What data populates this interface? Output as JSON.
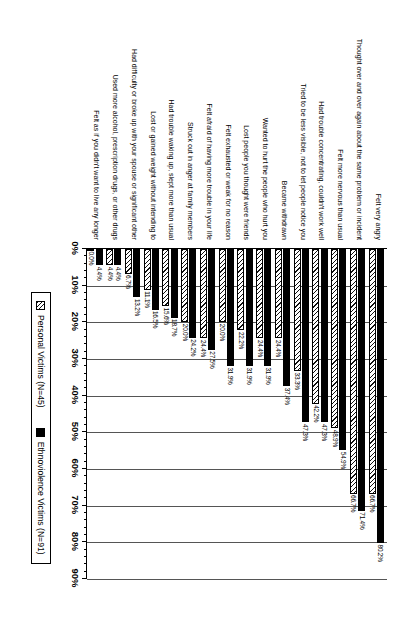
{
  "chart_data": {
    "type": "bar",
    "orientation": "horizontal",
    "title": "",
    "xlabel": "",
    "ylabel": "",
    "xlim": [
      0,
      90
    ],
    "xticks": [
      "0%",
      "10%",
      "20%",
      "30%",
      "40%",
      "50%",
      "60%",
      "70%",
      "80%",
      "90%"
    ],
    "grid": true,
    "legend_position": "bottom-right",
    "categories": [
      "Felt very angry",
      "Thought over and over again about the same problem or incident",
      "Felt more nervous than usual",
      "Had trouble concentrating, couldn't work well",
      "Tried to be less visible, not to let people notice you",
      "Became withdrawn",
      "Wanted to hurt the people who hurt you",
      "Lost people you thought were friends",
      "Felt exhausted or weak for no reason",
      "Felt afraid of having more trouble in your life",
      "Struck out in anger at family members",
      "Had trouble waking up, slept more than usual",
      "Lost or gained weight without intending to",
      "Had difficulty or broke up with your spouse or significant other",
      "Used more alcohol, prescription drugs, or other drugs",
      "Felt as if you didn't want to live any longer"
    ],
    "series": [
      {
        "name": "Ethnoviolence Victims (N=91)",
        "style": "solid-black",
        "color": "#000000",
        "values": [
          80.2,
          71.4,
          54.9,
          47.3,
          47.3,
          37.4,
          31.9,
          31.9,
          31.9,
          27.5,
          24.2,
          18.7,
          16.5,
          13.2,
          4.4,
          4.4
        ],
        "labels": [
          "80.2%",
          "71.4%",
          "54.9%",
          "47.3%",
          "47.3%",
          "37.4%",
          "31.9%",
          "31.9%",
          "31.9%",
          "27.5%",
          "24.2%",
          "18.7%",
          "16.5%",
          "13.2%",
          "4.4%",
          "4.4%"
        ]
      },
      {
        "name": "Personal Victims (N=45)",
        "style": "hatched",
        "color": "#ffffff",
        "values": [
          66.7,
          66.7,
          48.9,
          42.2,
          33.3,
          24.4,
          24.4,
          22.2,
          20.0,
          24.4,
          20.0,
          15.6,
          11.1,
          6.7,
          4.4,
          0.0
        ],
        "labels": [
          "66.7%",
          "66.7%",
          "48.9%",
          "42.2%",
          "33.3%",
          "24.4%",
          "24.4%",
          "22.2%",
          "20.0%",
          "24.4%",
          "20.0%",
          "15.6%",
          "11.1%",
          "6.7%",
          "4.4%",
          "0.0%"
        ]
      }
    ]
  },
  "legend": {
    "items": [
      {
        "label": "Personal Victims (N=45)",
        "swatch": "hatched"
      },
      {
        "label": "Ethnoviolence Victims (N=91)",
        "swatch": "solid-black"
      }
    ]
  }
}
